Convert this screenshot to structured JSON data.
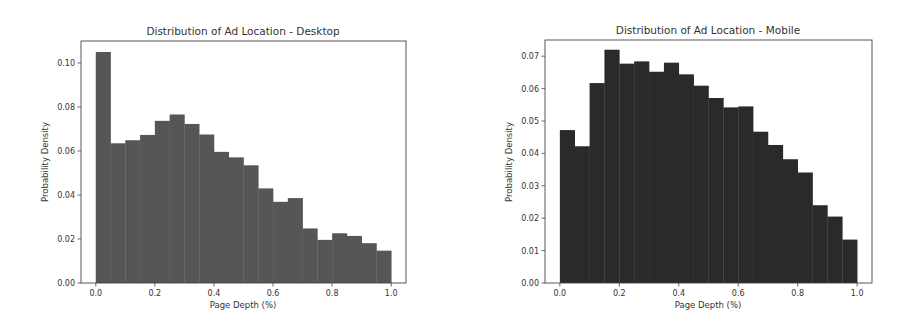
{
  "chart_data": [
    {
      "type": "bar",
      "title": "Distribution of Ad Location - Desktop",
      "xlabel": "Page Depth (%)",
      "ylabel": "Probability Density",
      "bin_edges": [
        0.0,
        0.05,
        0.1,
        0.15,
        0.2,
        0.25,
        0.3,
        0.35,
        0.4,
        0.45,
        0.5,
        0.55,
        0.6,
        0.65,
        0.7,
        0.75,
        0.8,
        0.85,
        0.9,
        0.95,
        1.0
      ],
      "values": [
        0.105,
        0.0635,
        0.0649,
        0.0673,
        0.0737,
        0.0766,
        0.0723,
        0.0675,
        0.0596,
        0.0571,
        0.0535,
        0.043,
        0.0369,
        0.0386,
        0.0248,
        0.0196,
        0.0226,
        0.0214,
        0.0181,
        0.0147
      ],
      "xlim": [
        -0.05,
        1.05
      ],
      "ylim": [
        0,
        0.11
      ],
      "xticks": [
        "0.0",
        "0.2",
        "0.4",
        "0.6",
        "0.8",
        "1.0"
      ],
      "yticks": [
        "0.00",
        "0.02",
        "0.04",
        "0.06",
        "0.08",
        "0.10"
      ],
      "bar_color": "#565656",
      "grid": false
    },
    {
      "type": "bar",
      "title": "Distribution of Ad Location - Mobile",
      "xlabel": "Page Depth (%)",
      "ylabel": "Probability Density",
      "bin_edges": [
        0.0,
        0.05,
        0.1,
        0.15,
        0.2,
        0.25,
        0.3,
        0.35,
        0.4,
        0.45,
        0.5,
        0.55,
        0.6,
        0.65,
        0.7,
        0.75,
        0.8,
        0.85,
        0.9,
        0.95,
        1.0
      ],
      "values": [
        0.0472,
        0.0422,
        0.0617,
        0.072,
        0.0677,
        0.0684,
        0.0652,
        0.068,
        0.0644,
        0.0609,
        0.0571,
        0.0542,
        0.0545,
        0.0467,
        0.0426,
        0.0382,
        0.0341,
        0.024,
        0.0205,
        0.0134
      ],
      "xlim": [
        -0.05,
        1.05
      ],
      "ylim": [
        0,
        0.075
      ],
      "xticks": [
        "0.0",
        "0.2",
        "0.4",
        "0.6",
        "0.8",
        "1.0"
      ],
      "yticks": [
        "0.00",
        "0.01",
        "0.02",
        "0.03",
        "0.04",
        "0.05",
        "0.06",
        "0.07"
      ],
      "bar_color": "#2a2a2a",
      "grid": false
    }
  ]
}
